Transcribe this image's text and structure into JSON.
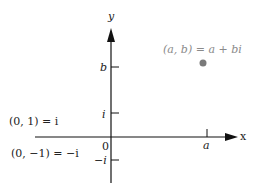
{
  "diagram": {
    "axes": {
      "x_label": "x",
      "y_label": "y",
      "origin_label": "0"
    },
    "ticks": {
      "x": [
        {
          "label": "a"
        }
      ],
      "y": [
        {
          "label": "b"
        },
        {
          "label": "i"
        },
        {
          "label": "−i"
        }
      ]
    },
    "point": {
      "label": "(a, b) = a + bi",
      "color": "#7a7a7a"
    },
    "annotations": [
      {
        "label": "(0, 1) = i"
      },
      {
        "label": "(0, −1) = −i"
      }
    ],
    "colors": {
      "axis": "#111111",
      "text": "#222222",
      "point_label": "#8a8a8a"
    }
  }
}
